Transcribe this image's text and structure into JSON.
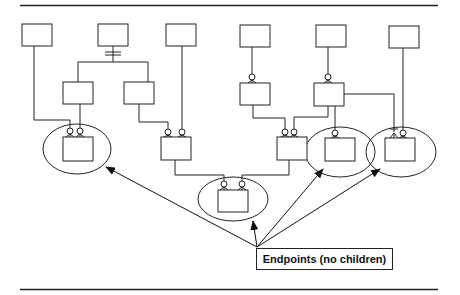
{
  "diagram": {
    "type": "entity-relationship hierarchy",
    "label": "Endpoints (no children)",
    "colors": {
      "stroke": "#222222",
      "background": "#ffffff"
    },
    "entities": [
      {
        "id": "A",
        "x": 22,
        "y": 24,
        "w": 30,
        "h": 22,
        "role": "root"
      },
      {
        "id": "B",
        "x": 98,
        "y": 24,
        "w": 30,
        "h": 22,
        "role": "root"
      },
      {
        "id": "C",
        "x": 166,
        "y": 24,
        "w": 30,
        "h": 22,
        "role": "root"
      },
      {
        "id": "D",
        "x": 240,
        "y": 25,
        "w": 30,
        "h": 22,
        "role": "root"
      },
      {
        "id": "E",
        "x": 316,
        "y": 25,
        "w": 30,
        "h": 22,
        "role": "root"
      },
      {
        "id": "F",
        "x": 389,
        "y": 26,
        "w": 30,
        "h": 22,
        "role": "root"
      },
      {
        "id": "G",
        "x": 63,
        "y": 82,
        "w": 30,
        "h": 22,
        "role": "intermediate"
      },
      {
        "id": "H",
        "x": 124,
        "y": 82,
        "w": 30,
        "h": 22,
        "role": "intermediate"
      },
      {
        "id": "I",
        "x": 240,
        "y": 83,
        "w": 30,
        "h": 22,
        "role": "intermediate"
      },
      {
        "id": "J",
        "x": 314,
        "y": 83,
        "w": 30,
        "h": 23,
        "role": "intermediate"
      },
      {
        "id": "K",
        "x": 63,
        "y": 137,
        "w": 30,
        "h": 24,
        "role": "endpoint"
      },
      {
        "id": "L",
        "x": 161,
        "y": 137,
        "w": 30,
        "h": 23,
        "role": "intermediate"
      },
      {
        "id": "M",
        "x": 277,
        "y": 137,
        "w": 30,
        "h": 23,
        "role": "intermediate"
      },
      {
        "id": "N",
        "x": 325,
        "y": 138,
        "w": 30,
        "h": 23,
        "role": "endpoint"
      },
      {
        "id": "O",
        "x": 385,
        "y": 138,
        "w": 30,
        "h": 23,
        "role": "endpoint"
      },
      {
        "id": "P",
        "x": 218,
        "y": 190,
        "w": 30,
        "h": 22,
        "role": "endpoint"
      }
    ],
    "endpoint_groups": [
      {
        "entity": "K",
        "cx": 77,
        "cy": 150,
        "rx": 34,
        "ry": 25
      },
      {
        "entity": "P",
        "cx": 233,
        "cy": 200,
        "rx": 35,
        "ry": 22
      },
      {
        "entity": "N",
        "cx": 340,
        "cy": 152,
        "rx": 35,
        "ry": 25
      },
      {
        "entity": "O",
        "cx": 401,
        "cy": 152,
        "rx": 35,
        "ry": 25
      }
    ],
    "callout_arrows": [
      {
        "from": [
          257,
          247
        ],
        "to": [
          105,
          167
        ]
      },
      {
        "from": [
          257,
          247
        ],
        "to": [
          254,
          220
        ]
      },
      {
        "from": [
          257,
          247
        ],
        "to": [
          323,
          168
        ]
      },
      {
        "from": [
          257,
          247
        ],
        "to": [
          380,
          168
        ]
      }
    ]
  }
}
